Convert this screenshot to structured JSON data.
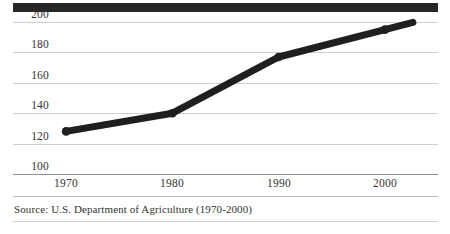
{
  "figure": {
    "source_note": "Source:  U.S. Department of Agriculture (1970-2000)"
  },
  "chart_data": {
    "type": "line",
    "title": "",
    "subtitle": "",
    "xlabel": "",
    "ylabel": "",
    "x": [
      1970,
      1980,
      1990,
      2000
    ],
    "categories": [
      "1970",
      "1980",
      "1990",
      "2000"
    ],
    "values": [
      128,
      140,
      177,
      195
    ],
    "series": [
      {
        "name": "",
        "values": [
          128,
          140,
          177,
          195
        ]
      }
    ],
    "xlim": [
      1965,
      2005
    ],
    "ylim": [
      100,
      200
    ],
    "ytick_labels": [
      "200",
      "180",
      "160",
      "140",
      "120",
      "100"
    ],
    "yticks": [
      200,
      180,
      160,
      140,
      120,
      100
    ],
    "xtick_labels": [
      "1970",
      "1980",
      "1990",
      "2000"
    ],
    "xticks": [
      1970,
      1980,
      1990,
      2000
    ],
    "grid": true,
    "legend": "none",
    "line_color": "#1f1f1f",
    "line_width": 7,
    "marker": "round",
    "annotations": []
  }
}
